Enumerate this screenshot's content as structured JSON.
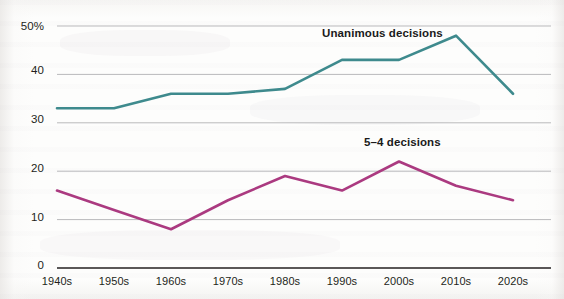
{
  "chart_data": {
    "type": "line",
    "title": "",
    "subtitle": "",
    "xlabel": "",
    "ylabel": "",
    "categories": [
      "1940s",
      "1950s",
      "1960s",
      "1970s",
      "1980s",
      "1990s",
      "2000s",
      "2010s",
      "2020s"
    ],
    "series": [
      {
        "name": "Unanimous decisions",
        "color": "#3e8a8d",
        "values": [
          33,
          33,
          36,
          36,
          37,
          43,
          43,
          48,
          36
        ]
      },
      {
        "name": "5–4 decisions",
        "color": "#ab3a80",
        "values": [
          16,
          12,
          8,
          14,
          19,
          16,
          22,
          17,
          14
        ]
      }
    ],
    "ylim": [
      0,
      50
    ],
    "yticks": [
      0,
      10,
      20,
      30,
      40,
      50
    ],
    "ytick_labels": [
      "0",
      "10",
      "20",
      "30",
      "40",
      "50%"
    ],
    "grid": true,
    "grid_axis": "y",
    "legend": "inline-annotations",
    "annotations": [
      {
        "text": "Unanimous decisions",
        "x": 4.55,
        "y": 48.6
      },
      {
        "text": "5–4 decisions",
        "x": 5.55,
        "y": 26.2
      }
    ]
  },
  "axis": {
    "y_labels": [
      "50%",
      "40",
      "30",
      "20",
      "10",
      "0"
    ],
    "x_labels": [
      "1940s",
      "1950s",
      "1960s",
      "1970s",
      "1980s",
      "1990s",
      "2000s",
      "2010s",
      "2020s"
    ]
  },
  "labels": {
    "unanimous": "Unanimous decisions",
    "five_four": "5–4 decisions"
  },
  "colors": {
    "unanimous_line": "#3e8a8d",
    "five_four_line": "#ab3a80",
    "gridline": "#b9b9bb",
    "axis": "#231f20",
    "background": "#fdfdfc"
  }
}
